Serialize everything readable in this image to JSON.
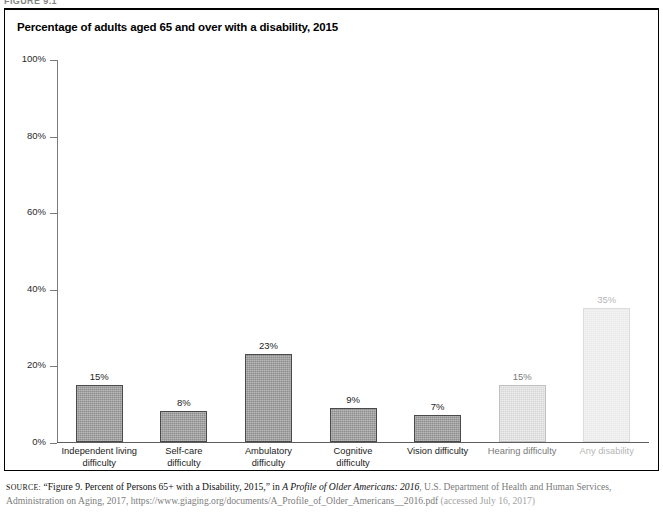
{
  "figure": {
    "number_label": "FIGURE 9.1"
  },
  "chart_title": "Percentage of adults aged 65 and over with a disability, 2015",
  "axis": {
    "y_ticks": [
      "100%",
      "80%",
      "60%",
      "40%",
      "20%",
      "0%"
    ]
  },
  "source": {
    "label": "SOURCE:",
    "part1": "“Figure 9. Percent of Persons 65+ with a Disability, 2015,” in ",
    "italic1": "A Profile of Older Americans: 2016",
    "part2": ", U.S. Department of Health and Human Services, Administration on Aging, 2017, https://www.giaging.org/documents/A_Profile_of_Older_Americans__2016.pdf ",
    "part3": "(accessed July 16, 2017)"
  },
  "chart_data": {
    "type": "bar",
    "title": "Percentage of adults aged 65 and over with a disability, 2015",
    "xlabel": "",
    "ylabel": "",
    "ylim": [
      0,
      100
    ],
    "yticks": [
      0,
      20,
      40,
      60,
      80,
      100
    ],
    "ytick_labels": [
      "0%",
      "20%",
      "40%",
      "60%",
      "80%",
      "100%"
    ],
    "grid": false,
    "legend": "none",
    "bar_color": "#9e9e9e",
    "bar_edge_color": "#4a4a4a",
    "categories": [
      "Independent living\ndifficulty",
      "Self-care\ndifficulty",
      "Ambulatory\ndifficulty",
      "Cognitive\ndifficulty",
      "Vision difficulty",
      "Hearing difficulty",
      "Any disability"
    ],
    "values": [
      15,
      8,
      23,
      9,
      7,
      15,
      35
    ],
    "data_labels": [
      "15%",
      "8%",
      "23%",
      "9%",
      "7%",
      "15%",
      "35%"
    ],
    "bars": [
      {
        "label_line1": "Independent living",
        "label_line2": "difficulty",
        "value": 15,
        "data_label": "15%",
        "fade": "none"
      },
      {
        "label_line1": "Self-care",
        "label_line2": "difficulty",
        "value": 8,
        "data_label": "8%",
        "fade": "none"
      },
      {
        "label_line1": "Ambulatory",
        "label_line2": "difficulty",
        "value": 23,
        "data_label": "23%",
        "fade": "none"
      },
      {
        "label_line1": "Cognitive",
        "label_line2": "difficulty",
        "value": 9,
        "data_label": "9%",
        "fade": "none"
      },
      {
        "label_line1": "Vision difficulty",
        "label_line2": "",
        "value": 7,
        "data_label": "7%",
        "fade": "none"
      },
      {
        "label_line1": "Hearing difficulty",
        "label_line2": "",
        "value": 15,
        "data_label": "15%",
        "fade": "faded-1"
      },
      {
        "label_line1": "Any disability",
        "label_line2": "",
        "value": 35,
        "data_label": "35%",
        "fade": "faded-2"
      }
    ]
  }
}
